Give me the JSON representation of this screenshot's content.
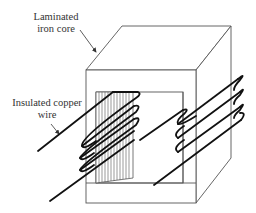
{
  "diagram": {
    "type": "transformer-core-illustration",
    "labels": {
      "core_line1": "Laminated",
      "core_line2": "iron core",
      "wire_line1": "Insulated copper",
      "wire_line2": "wire"
    },
    "components": [
      {
        "name": "laminated-iron-core",
        "description": "Rectangular box core with square window, drawn in 3D perspective"
      },
      {
        "name": "left-leg-laminations",
        "description": "Vertical hatching on left inner leg indicating laminations"
      },
      {
        "name": "left-winding",
        "description": "Insulated copper wire coil wrapped around left leg, 4 turns"
      },
      {
        "name": "right-winding",
        "description": "Insulated copper wire coil wrapped around right leg, 4 turns"
      }
    ],
    "colors": {
      "outline": "#555555",
      "wire": "#111111",
      "text": "#333333",
      "background": "#ffffff"
    }
  }
}
